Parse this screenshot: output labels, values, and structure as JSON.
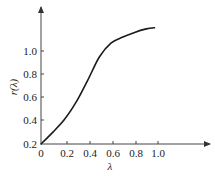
{
  "chart_data": {
    "type": "line",
    "title": "",
    "xlabel": "λ",
    "ylabel": "r(λ)",
    "xlim": [
      0,
      1.2
    ],
    "ylim": [
      0.2,
      1.3
    ],
    "x_ticks": [
      "0",
      "0.2",
      "0.4",
      "0.6",
      "0.8",
      "1.0"
    ],
    "y_ticks": [
      "0.2",
      "0.4",
      "0.6",
      "0.8",
      "1.0"
    ],
    "grid": false,
    "legend": null,
    "series": [
      {
        "name": "r(λ)",
        "x": [
          0.0,
          0.1,
          0.2,
          0.3,
          0.4,
          0.5,
          0.6,
          0.7,
          0.8,
          0.9,
          0.97
        ],
        "values": [
          0.2,
          0.3,
          0.41,
          0.56,
          0.75,
          0.95,
          1.07,
          1.12,
          1.16,
          1.19,
          1.2
        ]
      }
    ],
    "line_color": "#1a1a1a"
  }
}
